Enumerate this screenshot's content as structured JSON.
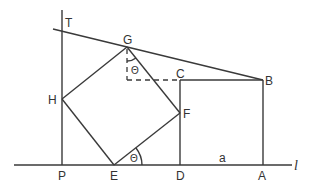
{
  "diagram": {
    "type": "geometry",
    "points": {
      "T": {
        "label": "T",
        "x": 62,
        "y": 29
      },
      "G": {
        "label": "G",
        "x": 127,
        "y": 47
      },
      "B": {
        "label": "B",
        "x": 263,
        "y": 80
      },
      "C": {
        "label": "C",
        "x": 180,
        "y": 80
      },
      "H": {
        "label": "H",
        "x": 62,
        "y": 99
      },
      "F": {
        "label": "F",
        "x": 180,
        "y": 113
      },
      "P": {
        "label": "P",
        "x": 62,
        "y": 165
      },
      "E": {
        "label": "E",
        "x": 114,
        "y": 165
      },
      "D": {
        "label": "D",
        "x": 180,
        "y": 165
      },
      "A": {
        "label": "A",
        "x": 263,
        "y": 165
      }
    },
    "labels": {
      "T": "T",
      "G": "G",
      "B": "B",
      "C": "C",
      "H": "H",
      "F": "F",
      "P": "P",
      "E": "E",
      "D": "D",
      "A": "A",
      "a": "a",
      "line_l": "l",
      "theta_top": "Θ",
      "theta_bottom": "Θ"
    },
    "segments": [
      {
        "from": "P",
        "to": "T",
        "style": "solid",
        "note": "vertical line through P"
      },
      {
        "from": "T",
        "to": "B",
        "style": "solid",
        "note": "line TGB"
      },
      {
        "from": "G",
        "to": "H",
        "style": "solid"
      },
      {
        "from": "H",
        "to": "E",
        "style": "solid"
      },
      {
        "from": "E",
        "to": "F",
        "style": "solid"
      },
      {
        "from": "F",
        "to": "G",
        "style": "solid"
      },
      {
        "from": "C",
        "to": "D",
        "style": "solid"
      },
      {
        "from": "C",
        "to": "B",
        "style": "solid"
      },
      {
        "from": "B",
        "to": "A",
        "style": "solid"
      },
      {
        "from": "G",
        "to": "G'",
        "style": "dashed",
        "note": "vertical drop from G"
      },
      {
        "from": "G'",
        "to": "C",
        "style": "dashed",
        "note": "horizontal to C"
      },
      {
        "from": "l-start",
        "to": "l-end",
        "style": "solid",
        "note": "baseline l"
      }
    ],
    "angles": [
      {
        "vertex": "E",
        "label": "Θ",
        "between": [
          "ED",
          "EF"
        ]
      },
      {
        "vertex": "G",
        "label": "Θ",
        "between": [
          "vertical",
          "GF"
        ]
      }
    ],
    "shapes": [
      {
        "name": "square EFGH",
        "vertices": [
          "E",
          "F",
          "G",
          "H"
        ]
      },
      {
        "name": "rectangle DABC",
        "vertices": [
          "D",
          "A",
          "B",
          "C"
        ]
      }
    ]
  }
}
